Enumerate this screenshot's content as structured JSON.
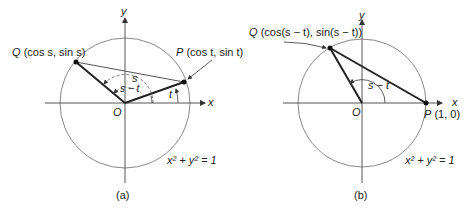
{
  "figures": [
    {
      "id": "a",
      "caption": "(a)",
      "axis_x": "x",
      "axis_y": "y",
      "origin": "O",
      "point_q": {
        "name": "Q",
        "coords": "(cos s, sin s)"
      },
      "point_p": {
        "name": "P",
        "coords": "(cos t, sin t)"
      },
      "angle_s": "s",
      "angle_s_minus_t": "s − t",
      "angle_t": "t",
      "equation": "x² + y² = 1"
    },
    {
      "id": "b",
      "caption": "(b)",
      "axis_x": "x",
      "axis_y": "y",
      "origin": "O",
      "point_q": {
        "name": "Q",
        "coords": "(cos(s − t), sin(s − t))"
      },
      "point_p": {
        "name": "P",
        "coords": "(1, 0)"
      },
      "angle_s_minus_t": "s − t",
      "equation": "x² + y² = 1"
    }
  ]
}
